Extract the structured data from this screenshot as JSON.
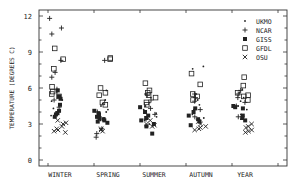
{
  "chart_data": {
    "type": "scatter",
    "title": "",
    "xlabel": "",
    "ylabel": "TEMPERATURE (DEGREES C)",
    "ylim": [
      -0.8,
      13.3
    ],
    "yticks": [
      0,
      3,
      6,
      9,
      12
    ],
    "grid": false,
    "legend_position": "upper right",
    "categories": [
      "WINTER",
      "SPRING",
      "SUMMER",
      "AUTUMN",
      "YEAR"
    ],
    "series": [
      {
        "name": "UKMO",
        "marker": "dot",
        "points": {
          "WINTER": [
            5.6,
            5.2,
            4.9,
            4.3,
            4.0,
            3.9,
            3.7,
            5.0
          ],
          "SPRING": [
            5.0,
            4.7,
            4.5,
            4.2,
            4.0,
            3.7,
            3.5,
            3.3,
            5.8
          ],
          "SUMMER": [
            5.5,
            5.2,
            4.8,
            4.5,
            4.2,
            3.9,
            3.6,
            3.3,
            3.0
          ],
          "AUTUMN": [
            7.8,
            7.6,
            5.5,
            5.0,
            4.6,
            4.2,
            3.8,
            3.5
          ],
          "YEAR": [
            5.9,
            5.6,
            5.2,
            4.9,
            4.5,
            4.2,
            3.8,
            3.4
          ]
        }
      },
      {
        "name": "NCAR",
        "marker": "plus",
        "points": {
          "WINTER": [
            11.8,
            11.0,
            10.5,
            8.3,
            7.3,
            6.9,
            5.9,
            5.0,
            4.4
          ],
          "SPRING": [
            8.3,
            4.0,
            3.5,
            2.6,
            2.2,
            1.9
          ],
          "SUMMER": [
            5.4,
            5.0,
            4.3,
            3.8,
            3.4
          ],
          "AUTUMN": [
            5.5,
            5.2,
            4.9,
            4.2,
            3.6
          ],
          "YEAR": [
            5.8,
            5.5,
            5.2,
            4.8,
            4.5,
            3.6
          ]
        }
      },
      {
        "name": "GISS",
        "marker": "filled-square",
        "points": {
          "WINTER": [
            5.8,
            5.3,
            5.1,
            4.6,
            4.1,
            3.9,
            3.8,
            3.6
          ],
          "SPRING": [
            4.1,
            3.9,
            3.8,
            3.6,
            3.5,
            3.4,
            3.3,
            3.2,
            3.1
          ],
          "SUMMER": [
            4.4,
            4.0,
            3.7,
            3.5,
            3.3,
            3.0,
            2.8,
            2.2
          ],
          "AUTUMN": [
            4.3,
            4.0,
            3.7,
            3.4,
            3.2,
            2.9
          ],
          "YEAR": [
            4.5,
            4.4,
            4.3,
            3.7,
            3.5,
            3.3
          ]
        }
      },
      {
        "name": "GFDL",
        "marker": "open-square",
        "points": {
          "WINTER": [
            9.3,
            8.4,
            7.6,
            6.1,
            5.7,
            5.5,
            5.3
          ],
          "SPRING": [
            8.4,
            8.5,
            6.0,
            5.6,
            5.4,
            4.8,
            4.6
          ],
          "SUMMER": [
            6.4,
            5.8,
            5.6,
            5.4,
            5.2,
            4.8,
            4.6
          ],
          "AUTUMN": [
            7.2,
            6.3,
            5.5,
            5.3,
            5.0
          ],
          "YEAR": [
            6.9,
            6.2,
            5.6,
            5.4,
            5.3,
            5.0
          ]
        }
      },
      {
        "name": "OSU",
        "marker": "x",
        "points": {
          "WINTER": [
            3.3,
            3.1,
            3.0,
            2.8,
            2.6,
            2.5,
            2.4,
            2.3
          ],
          "SPRING": [
            2.6,
            2.5,
            2.4
          ],
          "SUMMER": [
            3.3,
            3.0,
            2.9,
            2.8
          ],
          "AUTUMN": [
            3.2,
            3.0,
            2.8,
            2.7,
            2.6,
            2.5
          ],
          "YEAR": [
            3.0,
            2.8,
            2.7,
            2.5,
            2.4,
            2.3
          ]
        }
      }
    ]
  },
  "legend": {
    "items": [
      {
        "label": "UKMO",
        "marker": "dot"
      },
      {
        "label": "NCAR",
        "marker": "plus"
      },
      {
        "label": "GISS",
        "marker": "filled-square"
      },
      {
        "label": "GFDL",
        "marker": "open-square"
      },
      {
        "label": "OSU",
        "marker": "x"
      }
    ]
  },
  "axes": {
    "y_title": "TEMPERATURE (DEGREES C)",
    "y_ticks": [
      "0",
      "3",
      "6",
      "9",
      "12"
    ],
    "x_labels": [
      "WINTER",
      "SPRING",
      "SUMMER",
      "AUTUMN",
      "YEAR"
    ]
  }
}
